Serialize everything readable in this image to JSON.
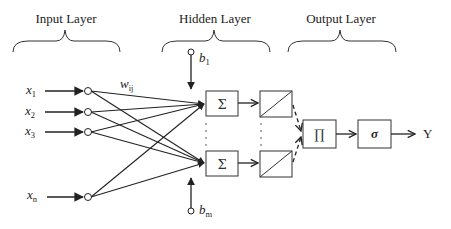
{
  "layers": {
    "input": {
      "title": "Input Layer"
    },
    "hidden": {
      "title": "Hidden Layer"
    },
    "output": {
      "title": "Output Layer"
    }
  },
  "inputs": [
    {
      "base": "x",
      "sub": "1"
    },
    {
      "base": "x",
      "sub": "2"
    },
    {
      "base": "x",
      "sub": "3"
    },
    {
      "base": "x",
      "sub": "n"
    }
  ],
  "weight_label": {
    "base": "w",
    "sub": "ij"
  },
  "biases": [
    {
      "base": "b",
      "sub": "1"
    },
    {
      "base": "b",
      "sub": "m"
    }
  ],
  "hidden_units": [
    {
      "sum_symbol": "Σ",
      "activation": "linear"
    },
    {
      "sum_symbol": "Σ",
      "activation": "linear"
    }
  ],
  "output_units": {
    "product_symbol": "∏",
    "sigmoid_symbol": "σ",
    "output_label": "Y"
  },
  "colors": {
    "stroke": "#222222",
    "background": "#ffffff"
  }
}
